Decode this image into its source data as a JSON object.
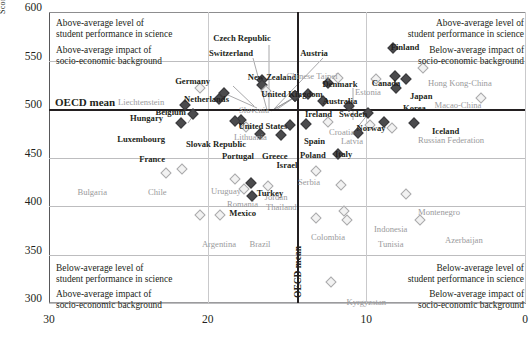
{
  "chart_data": {
    "type": "scatter",
    "title": "",
    "xlabel": "",
    "ylabel": "Score",
    "ylim": [
      300,
      600
    ],
    "xlim_left": 30,
    "xlim_right": 0,
    "x_axis_reversed": true,
    "yticks": [
      600,
      550,
      500,
      450,
      400,
      350,
      300
    ],
    "xticks": [
      30,
      20,
      10,
      0
    ],
    "grid": true,
    "reference_lines": {
      "horizontal": {
        "label": "OECD mean",
        "value": 500
      },
      "vertical": {
        "label": "OECD mean",
        "value": 14.4
      }
    },
    "legend": {
      "oecd_countries": "bold dark diamond",
      "partner_countries": "light grey hollow diamond"
    },
    "quadrant_notes": [
      {
        "position": "top-left",
        "lines": [
          "Above-average level of",
          "student performance in science",
          "Above-average impact of",
          "socio-economic background"
        ]
      },
      {
        "position": "top-right",
        "lines": [
          "Above-average level of",
          "student performance in science",
          "Below-average impact of",
          "socio-economic background"
        ]
      },
      {
        "position": "bottom-left",
        "lines": [
          "Below-average level of",
          "student performance in science",
          "Above-average impact of",
          "socio-economic background"
        ]
      },
      {
        "position": "bottom-right",
        "lines": [
          "Below-average level of",
          "student performance in science",
          "Below-average impact of",
          "socio-economic background"
        ]
      }
    ],
    "points": [
      {
        "name": "Czech Republic",
        "x": 14.5,
        "y": 513,
        "group": "oecd",
        "lx": 242,
        "ly": 34,
        "align": "ctr",
        "leader": [
          272,
          110
        ]
      },
      {
        "name": "Switzerland",
        "x": 14.5,
        "y": 513,
        "group": "oecd",
        "lx": 231,
        "ly": 49,
        "align": "ctr",
        "leader": [
          270,
          111
        ]
      },
      {
        "name": "Austria",
        "x": 14.5,
        "y": 513,
        "group": "oecd",
        "lx": 314,
        "ly": 49,
        "align": "ctr",
        "leader": [
          275,
          110
        ]
      },
      {
        "name": "Finland",
        "x": 8.3,
        "y": 563,
        "group": "oecd",
        "lx": 405,
        "ly": 43,
        "align": "ctr"
      },
      {
        "name": "Germany",
        "x": 19.0,
        "y": 516,
        "group": "oecd",
        "lx": 210,
        "ly": 77,
        "align": "rgt",
        "leader": [
          256,
          108
        ]
      },
      {
        "name": "New Zealand",
        "x": 16.6,
        "y": 530,
        "group": "oecd",
        "lx": 272,
        "ly": 73,
        "align": "ctr"
      },
      {
        "name": "Denmark",
        "x": 9.9,
        "y": 496,
        "group": "oecd",
        "lx": 340,
        "ly": 80,
        "align": "ctr",
        "leader": [
          352,
          133
        ]
      },
      {
        "name": "Hong Kong-China",
        "x": 6.4,
        "y": 542,
        "group": "partner",
        "lx": 428,
        "ly": 79,
        "align": "left"
      },
      {
        "name": "Canada",
        "x": 8.2,
        "y": 534,
        "group": "oecd",
        "lx": 386,
        "ly": 79,
        "align": "ctr"
      },
      {
        "name": "Liechtenstein",
        "x": 20.5,
        "y": 522,
        "group": "partner",
        "lx": 118,
        "ly": 98,
        "align": "left"
      },
      {
        "name": "Netherlands",
        "x": 16.6,
        "y": 525,
        "group": "oecd",
        "lx": 229,
        "ly": 95,
        "align": "rgt"
      },
      {
        "name": "Slovenia",
        "x": 16.3,
        "y": 519,
        "group": "partner",
        "lx": 239,
        "ly": 106,
        "align": "left"
      },
      {
        "name": "Chinese Taipei",
        "x": 11.8,
        "y": 532,
        "group": "partner",
        "lx": 312,
        "ly": 72,
        "align": "ctr"
      },
      {
        "name": "Estonia",
        "x": 9.4,
        "y": 531,
        "group": "partner",
        "lx": 368,
        "ly": 88,
        "align": "ctr"
      },
      {
        "name": "Japan",
        "x": 7.5,
        "y": 531,
        "group": "oecd",
        "lx": 410,
        "ly": 92,
        "align": "left"
      },
      {
        "name": "United Kingdom",
        "x": 13.7,
        "y": 515,
        "group": "oecd",
        "lx": 292,
        "ly": 90,
        "align": "ctr"
      },
      {
        "name": "Australia",
        "x": 12.4,
        "y": 527,
        "group": "oecd",
        "lx": 340,
        "ly": 97,
        "align": "ctr"
      },
      {
        "name": "Korea",
        "x": 8.1,
        "y": 522,
        "group": "oecd",
        "lx": 403,
        "ly": 104,
        "align": "left"
      },
      {
        "name": "Belgium",
        "x": 19.3,
        "y": 510,
        "group": "oecd",
        "lx": 186,
        "ly": 108,
        "align": "rgt"
      },
      {
        "name": "Hungary",
        "x": 21.4,
        "y": 504,
        "group": "oecd",
        "lx": 163,
        "ly": 114,
        "align": "rgt"
      },
      {
        "name": "Ireland",
        "x": 12.7,
        "y": 508,
        "group": "oecd",
        "lx": 305,
        "ly": 110,
        "align": "left"
      },
      {
        "name": "Sweden",
        "x": 11.1,
        "y": 503,
        "group": "oecd",
        "lx": 339,
        "ly": 110,
        "align": "left"
      },
      {
        "name": "Macao-China",
        "x": 2.8,
        "y": 511,
        "group": "partner",
        "lx": 458,
        "ly": 101,
        "align": "ctr"
      },
      {
        "name": "United States",
        "x": 17.9,
        "y": 489,
        "group": "oecd",
        "lx": 263,
        "ly": 122,
        "align": "ctr"
      },
      {
        "name": "Norway",
        "x": 8.9,
        "y": 487,
        "group": "oecd",
        "lx": 371,
        "ly": 124,
        "align": "ctr"
      },
      {
        "name": "Iceland",
        "x": 7.0,
        "y": 486,
        "group": "oecd",
        "lx": 432,
        "ly": 127,
        "align": "left"
      },
      {
        "name": "Croatia",
        "x": 12.4,
        "y": 487,
        "group": "partner",
        "lx": 329,
        "ly": 128,
        "align": "left"
      },
      {
        "name": "Spain",
        "x": 13.8,
        "y": 485,
        "group": "oecd",
        "lx": 304,
        "ly": 137,
        "align": "left"
      },
      {
        "name": "Latvia",
        "x": 9.8,
        "y": 483,
        "group": "partner",
        "lx": 352,
        "ly": 137,
        "align": "ctr"
      },
      {
        "name": "Russian Federation",
        "x": 8.4,
        "y": 480,
        "group": "partner",
        "lx": 418,
        "ly": 136,
        "align": "left"
      },
      {
        "name": "Lithuania",
        "x": 17.6,
        "y": 481,
        "group": "partner",
        "lx": 234,
        "ly": 133,
        "align": "left"
      },
      {
        "name": "Luxembourg",
        "x": 21.7,
        "y": 486,
        "group": "oecd",
        "lx": 165,
        "ly": 135,
        "align": "rgt"
      },
      {
        "name": "France",
        "x": 20.9,
        "y": 495,
        "group": "oecd",
        "lx": 165,
        "ly": 155,
        "align": "rgt",
        "leader": [
          187,
          123
        ]
      },
      {
        "name": "Slovak Republic",
        "x": 18.3,
        "y": 488,
        "group": "oecd",
        "lx": 216,
        "ly": 140,
        "align": "ctr"
      },
      {
        "name": "Italy",
        "x": 10.5,
        "y": 475,
        "group": "oecd",
        "lx": 335,
        "ly": 150,
        "align": "left"
      },
      {
        "name": "Portugal",
        "x": 16.7,
        "y": 474,
        "group": "oecd",
        "lx": 254,
        "ly": 152,
        "align": "rgt"
      },
      {
        "name": "Greece",
        "x": 15.4,
        "y": 473,
        "group": "oecd",
        "lx": 262,
        "ly": 152,
        "align": "left"
      },
      {
        "name": "Poland",
        "x": 14.8,
        "y": 483,
        "group": "oecd",
        "lx": 300,
        "ly": 151,
        "align": "left"
      },
      {
        "name": "Israel",
        "x": 11.8,
        "y": 454,
        "group": "oecd",
        "lx": 287,
        "ly": 161,
        "align": "ctr"
      },
      {
        "name": "Serbia",
        "x": 13.2,
        "y": 436,
        "group": "partner",
        "lx": 309,
        "ly": 178,
        "align": "ctr"
      },
      {
        "name": "Bulgaria",
        "x": 22.6,
        "y": 434,
        "group": "partner",
        "lx": 107,
        "ly": 188,
        "align": "rgt"
      },
      {
        "name": "Chile",
        "x": 21.6,
        "y": 438,
        "group": "partner",
        "lx": 148,
        "ly": 188,
        "align": "left"
      },
      {
        "name": "Jordan",
        "x": 11.6,
        "y": 422,
        "group": "partner",
        "lx": 276,
        "ly": 193,
        "align": "ctr"
      },
      {
        "name": "Uruguay",
        "x": 18.3,
        "y": 428,
        "group": "partner",
        "lx": 226,
        "ly": 187,
        "align": "ctr"
      },
      {
        "name": "Turkey",
        "x": 17.3,
        "y": 424,
        "group": "oecd",
        "lx": 270,
        "ly": 189,
        "align": "ctr"
      },
      {
        "name": "Romania",
        "x": 17.7,
        "y": 418,
        "group": "partner",
        "lx": 258,
        "ly": 200,
        "align": "rgt"
      },
      {
        "name": "Thailand",
        "x": 16.2,
        "y": 421,
        "group": "partner",
        "lx": 266,
        "ly": 203,
        "align": "left"
      },
      {
        "name": "Mexico",
        "x": 17.2,
        "y": 410,
        "group": "oecd",
        "lx": 256,
        "ly": 209,
        "align": "rgt"
      },
      {
        "name": "Montenegro",
        "x": 7.5,
        "y": 412,
        "group": "partner",
        "lx": 418,
        "ly": 208,
        "align": "left"
      },
      {
        "name": "Argentina",
        "x": 20.5,
        "y": 391,
        "group": "partner",
        "lx": 219,
        "ly": 240,
        "align": "ctr"
      },
      {
        "name": "Brazil",
        "x": 19.2,
        "y": 391,
        "group": "partner",
        "lx": 260,
        "ly": 240,
        "align": "ctr"
      },
      {
        "name": "Indonesia",
        "x": 11.4,
        "y": 395,
        "group": "partner",
        "lx": 374,
        "ly": 225,
        "align": "left"
      },
      {
        "name": "Colombia",
        "x": 13.2,
        "y": 388,
        "group": "partner",
        "lx": 345,
        "ly": 233,
        "align": "rgt"
      },
      {
        "name": "Tunisia",
        "x": 11.2,
        "y": 386,
        "group": "partner",
        "lx": 378,
        "ly": 240,
        "align": "left"
      },
      {
        "name": "Azerbaijan",
        "x": 6.6,
        "y": 386,
        "group": "partner",
        "lx": 445,
        "ly": 236,
        "align": "left"
      },
      {
        "name": "Kyrgyzstan",
        "x": 12.2,
        "y": 322,
        "group": "partner",
        "lx": 386,
        "ly": 298,
        "align": "rgt"
      }
    ]
  }
}
